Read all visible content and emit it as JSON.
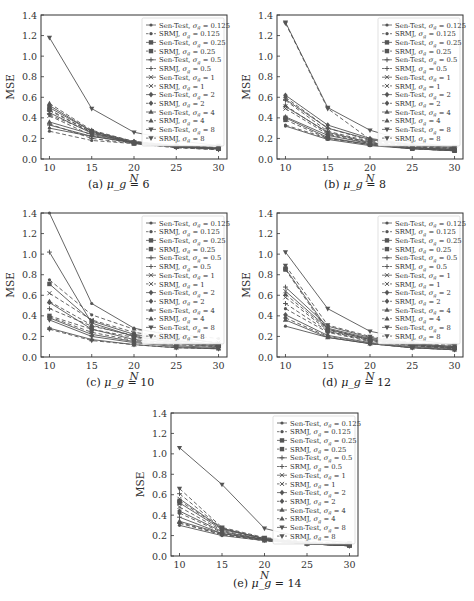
{
  "figure": {
    "legend_entries": [
      {
        "label": "Sen-Test, σ_g = 0.125",
        "method": "Sen-Test",
        "sigma": "0.125",
        "marker": "dot",
        "dash": false
      },
      {
        "label": "SRMJ, σ_g = 0.125",
        "method": "SRMJ",
        "sigma": "0.125",
        "marker": "dot",
        "dash": true
      },
      {
        "label": "Sen-Test, σ_g = 0.25",
        "method": "Sen-Test",
        "sigma": "0.25",
        "marker": "square",
        "dash": false
      },
      {
        "label": "SRMJ, σ_g = 0.25",
        "method": "SRMJ",
        "sigma": "0.25",
        "marker": "square",
        "dash": true
      },
      {
        "label": "Sen-Test, σ_g = 0.5",
        "method": "Sen-Test",
        "sigma": "0.5",
        "marker": "plus",
        "dash": false
      },
      {
        "label": "SRMJ, σ_g = 0.5",
        "method": "SRMJ",
        "sigma": "0.5",
        "marker": "plus",
        "dash": true
      },
      {
        "label": "Sen-Test, σ_g = 1",
        "method": "Sen-Test",
        "sigma": "1",
        "marker": "x",
        "dash": false
      },
      {
        "label": "SRMJ, σ_g = 1",
        "method": "SRMJ",
        "sigma": "1",
        "marker": "x",
        "dash": true
      },
      {
        "label": "Sen-Test, σ_g = 2",
        "method": "Sen-Test",
        "sigma": "2",
        "marker": "diamond",
        "dash": false
      },
      {
        "label": "SRMJ, σ_g = 2",
        "method": "SRMJ",
        "sigma": "2",
        "marker": "diamond",
        "dash": true
      },
      {
        "label": "Sen-Test, σ_g = 4",
        "method": "Sen-Test",
        "sigma": "4",
        "marker": "triangle",
        "dash": false
      },
      {
        "label": "SRMJ, σ_g = 4",
        "method": "SRMJ",
        "sigma": "4",
        "marker": "triangle",
        "dash": true
      },
      {
        "label": "Sen-Test, σ_g = 8",
        "method": "Sen-Test",
        "sigma": "8",
        "marker": "tri-down",
        "dash": false
      },
      {
        "label": "SRMJ, σ_g = 8",
        "method": "SRMJ",
        "sigma": "8",
        "marker": "tri-down",
        "dash": true
      }
    ],
    "colors": {
      "line": "#555555",
      "frame": "#333333",
      "background": "#ffffff"
    }
  },
  "chart_data": [
    {
      "type": "line",
      "id": "a",
      "caption_prefix": "(a)",
      "caption_var": "μ_g",
      "caption_value": "= 6",
      "title": "(a) μ_g = 6",
      "xlabel": "N",
      "ylabel": "MSE",
      "x": [
        10,
        15,
        20,
        25,
        30
      ],
      "xticks": [
        "10",
        "15",
        "20",
        "25",
        "30"
      ],
      "yticks": [
        "0.0",
        "0.2",
        "0.4",
        "0.6",
        "0.8",
        "1.0",
        "1.2",
        "1.4"
      ],
      "ylim": [
        0,
        1.4
      ],
      "xlim": [
        9,
        31
      ],
      "grid": false,
      "legend_position": "upper right",
      "series": [
        {
          "name": "Sen-Test, σ_g = 0.125",
          "values": [
            0.3,
            0.22,
            0.16,
            0.12,
            0.1
          ]
        },
        {
          "name": "SRMJ, σ_g = 0.125",
          "values": [
            0.27,
            0.18,
            0.15,
            0.11,
            0.09
          ]
        },
        {
          "name": "Sen-Test, σ_g = 0.25",
          "values": [
            0.5,
            0.27,
            0.16,
            0.12,
            0.1
          ]
        },
        {
          "name": "SRMJ, σ_g = 0.25",
          "values": [
            0.48,
            0.26,
            0.15,
            0.12,
            0.1
          ]
        },
        {
          "name": "Sen-Test, σ_g = 0.5",
          "values": [
            0.33,
            0.22,
            0.16,
            0.12,
            0.1
          ]
        },
        {
          "name": "SRMJ, σ_g = 0.5",
          "values": [
            0.34,
            0.2,
            0.15,
            0.11,
            0.09
          ]
        },
        {
          "name": "Sen-Test, σ_g = 1",
          "values": [
            0.45,
            0.25,
            0.16,
            0.12,
            0.1
          ]
        },
        {
          "name": "SRMJ, σ_g = 1",
          "values": [
            0.42,
            0.23,
            0.15,
            0.12,
            0.1
          ]
        },
        {
          "name": "Sen-Test, σ_g = 2",
          "values": [
            0.52,
            0.27,
            0.17,
            0.13,
            0.11
          ]
        },
        {
          "name": "SRMJ, σ_g = 2",
          "values": [
            0.47,
            0.26,
            0.16,
            0.12,
            0.1
          ]
        },
        {
          "name": "Sen-Test, σ_g = 4",
          "values": [
            0.36,
            0.24,
            0.16,
            0.12,
            0.1
          ]
        },
        {
          "name": "SRMJ, σ_g = 4",
          "values": [
            0.54,
            0.28,
            0.17,
            0.13,
            0.11
          ]
        },
        {
          "name": "Sen-Test, σ_g = 8",
          "values": [
            1.18,
            0.49,
            0.26,
            0.18,
            0.13
          ]
        },
        {
          "name": "SRMJ, σ_g = 8",
          "values": [
            0.43,
            0.26,
            0.16,
            0.12,
            0.1
          ]
        }
      ]
    },
    {
      "type": "line",
      "id": "b",
      "caption_prefix": "(b)",
      "caption_var": "μ_g",
      "caption_value": "= 8",
      "title": "(b) μ_g = 8",
      "xlabel": "N",
      "ylabel": "MSE",
      "x": [
        10,
        15,
        20,
        25,
        30
      ],
      "xticks": [
        "10",
        "15",
        "20",
        "25",
        "30"
      ],
      "yticks": [
        "0.0",
        "0.2",
        "0.4",
        "0.6",
        "0.8",
        "1.0",
        "1.2",
        "1.4"
      ],
      "ylim": [
        0,
        1.4
      ],
      "xlim": [
        9,
        31
      ],
      "grid": false,
      "legend_position": "upper right",
      "series": [
        {
          "name": "Sen-Test, σ_g = 0.125",
          "values": [
            0.32,
            0.19,
            0.13,
            0.1,
            0.08
          ]
        },
        {
          "name": "SRMJ, σ_g = 0.125",
          "values": [
            0.33,
            0.2,
            0.14,
            0.1,
            0.08
          ]
        },
        {
          "name": "Sen-Test, σ_g = 0.25",
          "values": [
            0.4,
            0.21,
            0.14,
            0.1,
            0.08
          ]
        },
        {
          "name": "SRMJ, σ_g = 0.25",
          "values": [
            0.38,
            0.2,
            0.14,
            0.1,
            0.08
          ]
        },
        {
          "name": "Sen-Test, σ_g = 0.5",
          "values": [
            0.58,
            0.3,
            0.19,
            0.13,
            0.1
          ]
        },
        {
          "name": "SRMJ, σ_g = 0.5",
          "values": [
            0.57,
            0.27,
            0.17,
            0.12,
            0.09
          ]
        },
        {
          "name": "Sen-Test, σ_g = 1",
          "values": [
            0.51,
            0.26,
            0.16,
            0.11,
            0.09
          ]
        },
        {
          "name": "SRMJ, σ_g = 1",
          "values": [
            0.49,
            0.24,
            0.15,
            0.11,
            0.09
          ]
        },
        {
          "name": "Sen-Test, σ_g = 2",
          "values": [
            0.62,
            0.33,
            0.2,
            0.14,
            0.11
          ]
        },
        {
          "name": "SRMJ, σ_g = 2",
          "values": [
            0.6,
            0.3,
            0.18,
            0.12,
            0.1
          ]
        },
        {
          "name": "Sen-Test, σ_g = 4",
          "values": [
            0.41,
            0.23,
            0.15,
            0.11,
            0.09
          ]
        },
        {
          "name": "SRMJ, σ_g = 4",
          "values": [
            0.52,
            0.25,
            0.16,
            0.11,
            0.09
          ]
        },
        {
          "name": "Sen-Test, σ_g = 8",
          "values": [
            1.33,
            0.5,
            0.28,
            0.16,
            0.12
          ]
        },
        {
          "name": "SRMJ, σ_g = 8",
          "values": [
            1.32,
            0.49,
            0.19,
            0.13,
            0.11
          ]
        }
      ]
    },
    {
      "type": "line",
      "id": "c",
      "caption_prefix": "(c)",
      "caption_var": "μ_g",
      "caption_value": "= 10",
      "title": "(c) μ_g = 10",
      "xlabel": "N",
      "ylabel": "MSE",
      "x": [
        10,
        15,
        20,
        25,
        30
      ],
      "xticks": [
        "10",
        "15",
        "20",
        "25",
        "30"
      ],
      "yticks": [
        "0.0",
        "0.2",
        "0.4",
        "0.6",
        "0.8",
        "1.0",
        "1.2",
        "1.4"
      ],
      "ylim": [
        0,
        1.4
      ],
      "xlim": [
        9,
        31
      ],
      "grid": false,
      "legend_position": "upper right",
      "series": [
        {
          "name": "Sen-Test, σ_g = 0.125",
          "values": [
            1.4,
            0.52,
            0.28,
            0.2,
            0.13
          ]
        },
        {
          "name": "SRMJ, σ_g = 0.125",
          "values": [
            0.75,
            0.41,
            0.27,
            0.22,
            0.18
          ]
        },
        {
          "name": "Sen-Test, σ_g = 0.25",
          "values": [
            0.71,
            0.35,
            0.22,
            0.16,
            0.12
          ]
        },
        {
          "name": "SRMJ, σ_g = 0.25",
          "values": [
            0.4,
            0.27,
            0.19,
            0.14,
            0.11
          ]
        },
        {
          "name": "Sen-Test, σ_g = 0.5",
          "values": [
            1.02,
            0.33,
            0.2,
            0.14,
            0.11
          ]
        },
        {
          "name": "SRMJ, σ_g = 0.5",
          "values": [
            0.47,
            0.3,
            0.21,
            0.16,
            0.12
          ]
        },
        {
          "name": "Sen-Test, σ_g = 1",
          "values": [
            0.38,
            0.22,
            0.15,
            0.11,
            0.09
          ]
        },
        {
          "name": "SRMJ, σ_g = 1",
          "values": [
            0.62,
            0.36,
            0.24,
            0.18,
            0.14
          ]
        },
        {
          "name": "Sen-Test, σ_g = 2",
          "values": [
            0.53,
            0.27,
            0.17,
            0.13,
            0.1
          ]
        },
        {
          "name": "SRMJ, σ_g = 2",
          "values": [
            0.39,
            0.24,
            0.16,
            0.12,
            0.1
          ]
        },
        {
          "name": "Sen-Test, σ_g = 4",
          "values": [
            0.28,
            0.17,
            0.12,
            0.09,
            0.08
          ]
        },
        {
          "name": "SRMJ, σ_g = 4",
          "values": [
            0.54,
            0.31,
            0.2,
            0.15,
            0.12
          ]
        },
        {
          "name": "Sen-Test, σ_g = 8",
          "values": [
            0.36,
            0.2,
            0.14,
            0.1,
            0.08
          ]
        },
        {
          "name": "SRMJ, σ_g = 8",
          "values": [
            0.27,
            0.16,
            0.12,
            0.09,
            0.08
          ]
        }
      ]
    },
    {
      "type": "line",
      "id": "d",
      "caption_prefix": "(d)",
      "caption_var": "μ_g",
      "caption_value": "= 12",
      "title": "(d) μ_g = 12",
      "xlabel": "N",
      "ylabel": "MSE",
      "x": [
        10,
        15,
        20,
        25,
        30
      ],
      "xticks": [
        "10",
        "15",
        "20",
        "25",
        "30"
      ],
      "yticks": [
        "0.0",
        "0.2",
        "0.4",
        "0.6",
        "0.8",
        "1.0",
        "1.2",
        "1.4"
      ],
      "ylim": [
        0,
        1.4
      ],
      "xlim": [
        9,
        31
      ],
      "grid": false,
      "legend_position": "upper right",
      "series": [
        {
          "name": "Sen-Test, σ_g = 0.125",
          "values": [
            0.3,
            0.19,
            0.13,
            0.09,
            0.07
          ]
        },
        {
          "name": "SRMJ, σ_g = 0.125",
          "values": [
            0.47,
            0.24,
            0.15,
            0.11,
            0.08
          ]
        },
        {
          "name": "Sen-Test, σ_g = 0.25",
          "values": [
            0.86,
            0.27,
            0.17,
            0.12,
            0.09
          ]
        },
        {
          "name": "SRMJ, σ_g = 0.25",
          "values": [
            0.85,
            0.25,
            0.16,
            0.11,
            0.09
          ]
        },
        {
          "name": "Sen-Test, σ_g = 0.5",
          "values": [
            0.68,
            0.3,
            0.19,
            0.13,
            0.1
          ]
        },
        {
          "name": "SRMJ, σ_g = 0.5",
          "values": [
            0.52,
            0.25,
            0.16,
            0.11,
            0.09
          ]
        },
        {
          "name": "Sen-Test, σ_g = 1",
          "values": [
            0.64,
            0.28,
            0.18,
            0.13,
            0.1
          ]
        },
        {
          "name": "SRMJ, σ_g = 1",
          "values": [
            0.58,
            0.26,
            0.17,
            0.12,
            0.09
          ]
        },
        {
          "name": "Sen-Test, σ_g = 2",
          "values": [
            0.41,
            0.21,
            0.14,
            0.1,
            0.08
          ]
        },
        {
          "name": "SRMJ, σ_g = 2",
          "values": [
            0.38,
            0.2,
            0.13,
            0.09,
            0.07
          ]
        },
        {
          "name": "Sen-Test, σ_g = 4",
          "values": [
            0.36,
            0.19,
            0.13,
            0.09,
            0.07
          ]
        },
        {
          "name": "SRMJ, σ_g = 4",
          "values": [
            0.61,
            0.27,
            0.17,
            0.12,
            0.09
          ]
        },
        {
          "name": "Sen-Test, σ_g = 8",
          "values": [
            1.02,
            0.47,
            0.25,
            0.17,
            0.12
          ]
        },
        {
          "name": "SRMJ, σ_g = 8",
          "values": [
            0.89,
            0.31,
            0.2,
            0.14,
            0.11
          ]
        }
      ]
    },
    {
      "type": "line",
      "id": "e",
      "caption_prefix": "(e)",
      "caption_var": "μ_g",
      "caption_value": "= 14",
      "title": "(e) μ_g = 14",
      "xlabel": "N",
      "ylabel": "MSE",
      "x": [
        10,
        15,
        20,
        25,
        30
      ],
      "xticks": [
        "10",
        "15",
        "20",
        "25",
        "30"
      ],
      "yticks": [
        "0.0",
        "0.2",
        "0.4",
        "0.6",
        "0.8",
        "1.0",
        "1.2",
        "1.4"
      ],
      "ylim": [
        0,
        1.4
      ],
      "xlim": [
        9,
        31
      ],
      "grid": false,
      "legend_position": "upper right",
      "series": [
        {
          "name": "Sen-Test, σ_g = 0.125",
          "values": [
            0.3,
            0.2,
            0.15,
            0.12,
            0.1
          ]
        },
        {
          "name": "SRMJ, σ_g = 0.125",
          "values": [
            0.32,
            0.21,
            0.15,
            0.12,
            0.1
          ]
        },
        {
          "name": "Sen-Test, σ_g = 0.25",
          "values": [
            0.52,
            0.26,
            0.17,
            0.13,
            0.11
          ]
        },
        {
          "name": "SRMJ, σ_g = 0.25",
          "values": [
            0.54,
            0.27,
            0.17,
            0.13,
            0.11
          ]
        },
        {
          "name": "Sen-Test, σ_g = 0.5",
          "values": [
            0.38,
            0.22,
            0.16,
            0.12,
            0.1
          ]
        },
        {
          "name": "SRMJ, σ_g = 0.5",
          "values": [
            0.61,
            0.27,
            0.17,
            0.13,
            0.11
          ]
        },
        {
          "name": "Sen-Test, σ_g = 1",
          "values": [
            0.56,
            0.27,
            0.17,
            0.13,
            0.11
          ]
        },
        {
          "name": "SRMJ, σ_g = 1",
          "values": [
            0.48,
            0.25,
            0.16,
            0.12,
            0.1
          ]
        },
        {
          "name": "Sen-Test, σ_g = 2",
          "values": [
            0.44,
            0.24,
            0.16,
            0.12,
            0.1
          ]
        },
        {
          "name": "SRMJ, σ_g = 2",
          "values": [
            0.42,
            0.23,
            0.16,
            0.12,
            0.1
          ]
        },
        {
          "name": "Sen-Test, σ_g = 4",
          "values": [
            0.34,
            0.22,
            0.16,
            0.12,
            0.1
          ]
        },
        {
          "name": "SRMJ, σ_g = 4",
          "values": [
            0.33,
            0.21,
            0.15,
            0.12,
            0.1
          ]
        },
        {
          "name": "Sen-Test, σ_g = 8",
          "values": [
            1.06,
            0.7,
            0.27,
            0.17,
            0.13
          ]
        },
        {
          "name": "SRMJ, σ_g = 8",
          "values": [
            0.66,
            0.28,
            0.18,
            0.14,
            0.12
          ]
        }
      ]
    }
  ]
}
